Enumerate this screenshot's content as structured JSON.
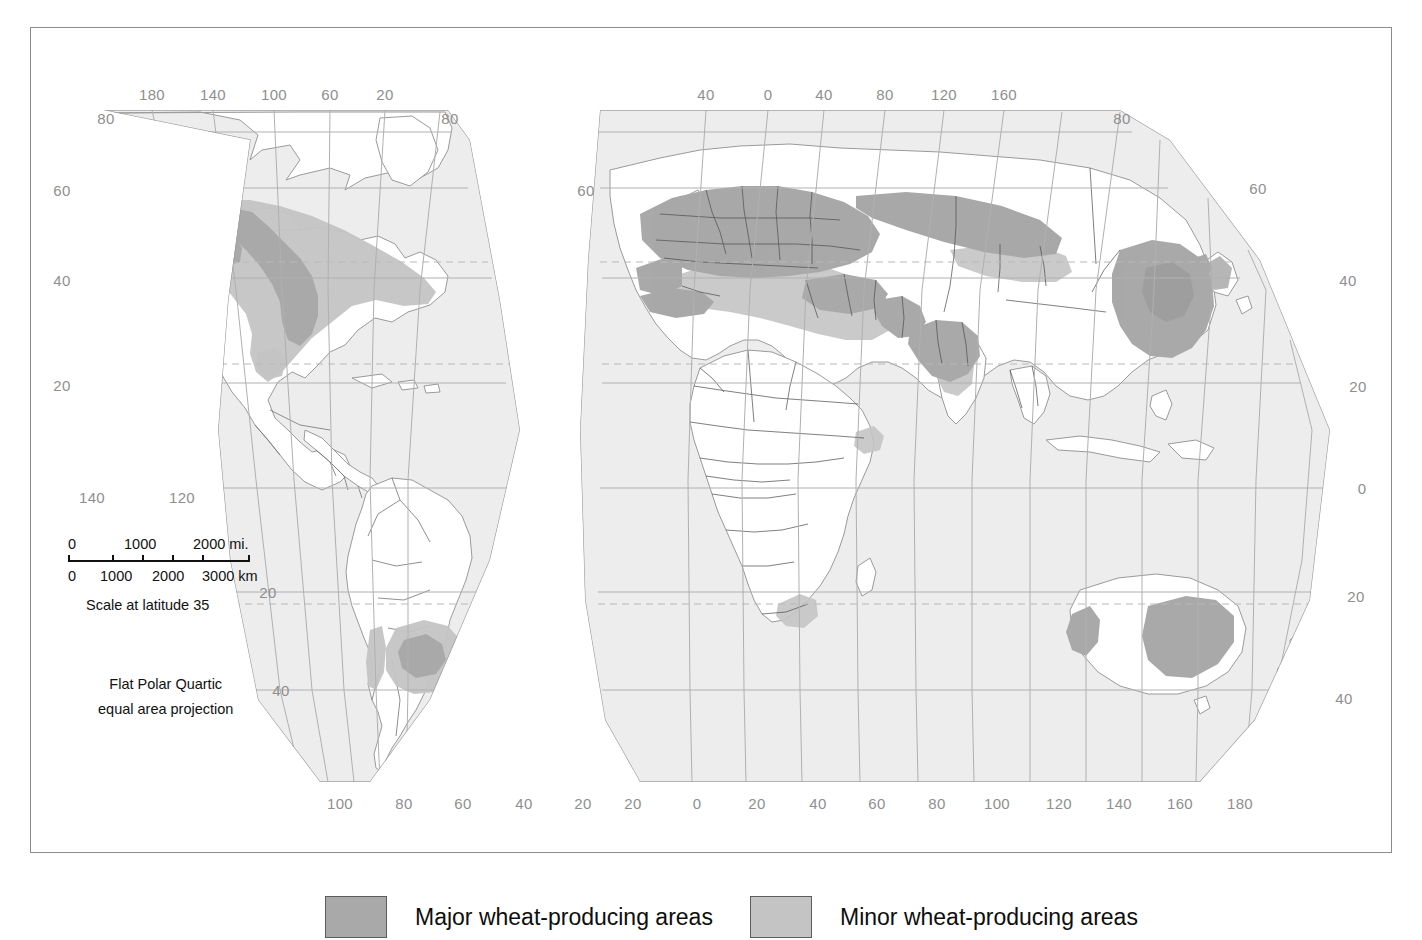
{
  "map": {
    "title": "World wheat production",
    "projection_note_line1": "Flat Polar Quartic",
    "projection_note_line2": "equal area projection",
    "scale_note": "Scale at latitude 35",
    "scale": {
      "miles": {
        "ticks": [
          "0",
          "1000",
          "2000 mi."
        ]
      },
      "km": {
        "ticks": [
          "0",
          "1000",
          "2000",
          "3000 km"
        ]
      }
    },
    "colors": {
      "major_fill": "#a9a9a9",
      "minor_fill": "#c4c4c4",
      "ocean_fill": "#ededed",
      "land_fill": "#ffffff",
      "graticule": "#b0b0b0",
      "coastline": "#9a9a9a",
      "border": "#8c8c8c",
      "tropic_line": "#b9b9b9",
      "label": "#8f8f8f"
    },
    "graticule_labels": {
      "top_left_lobe": [
        {
          "text": "180",
          "x": 152,
          "y": 86
        },
        {
          "text": "140",
          "x": 213,
          "y": 86
        },
        {
          "text": "100",
          "x": 274,
          "y": 86
        },
        {
          "text": "60",
          "x": 330,
          "y": 86
        },
        {
          "text": "20",
          "x": 385,
          "y": 86
        }
      ],
      "top_right_lobe": [
        {
          "text": "40",
          "x": 706,
          "y": 86
        },
        {
          "text": "0",
          "x": 768,
          "y": 86
        },
        {
          "text": "40",
          "x": 824,
          "y": 86
        },
        {
          "text": "80",
          "x": 885,
          "y": 86
        },
        {
          "text": "120",
          "x": 944,
          "y": 86
        },
        {
          "text": "160",
          "x": 1004,
          "y": 86
        }
      ],
      "upper_corner_lat": [
        {
          "text": "80",
          "x": 106,
          "y": 110
        },
        {
          "text": "80",
          "x": 450,
          "y": 110
        },
        {
          "text": "80",
          "x": 1122,
          "y": 110
        }
      ],
      "left_lat": [
        {
          "text": "60",
          "x": 62,
          "y": 182
        },
        {
          "text": "40",
          "x": 62,
          "y": 272
        },
        {
          "text": "20",
          "x": 62,
          "y": 377
        }
      ],
      "mid_left_lat": [
        {
          "text": "60",
          "x": 586,
          "y": 182
        }
      ],
      "right_lat": [
        {
          "text": "60",
          "x": 1258,
          "y": 180
        },
        {
          "text": "40",
          "x": 1348,
          "y": 272
        },
        {
          "text": "20",
          "x": 1358,
          "y": 378
        },
        {
          "text": "0",
          "x": 1362,
          "y": 480
        },
        {
          "text": "20",
          "x": 1356,
          "y": 588
        },
        {
          "text": "40",
          "x": 1344,
          "y": 690
        }
      ],
      "samerica_lon": [
        {
          "text": "140",
          "x": 92,
          "y": 489
        },
        {
          "text": "120",
          "x": 182,
          "y": 489
        }
      ],
      "samerica_lat": [
        {
          "text": "20",
          "x": 268,
          "y": 584
        },
        {
          "text": "40",
          "x": 281,
          "y": 682
        }
      ],
      "bottom_left_lobe": [
        {
          "text": "100",
          "x": 340,
          "y": 795
        },
        {
          "text": "80",
          "x": 404,
          "y": 795
        },
        {
          "text": "60",
          "x": 463,
          "y": 795
        },
        {
          "text": "20",
          "x": 583,
          "y": 795
        },
        {
          "text": "40",
          "x": 524,
          "y": 795
        }
      ],
      "bottom_right_lobe": [
        {
          "text": "20",
          "x": 633,
          "y": 795
        },
        {
          "text": "0",
          "x": 697,
          "y": 795
        },
        {
          "text": "20",
          "x": 757,
          "y": 795
        },
        {
          "text": "40",
          "x": 818,
          "y": 795
        },
        {
          "text": "60",
          "x": 877,
          "y": 795
        },
        {
          "text": "80",
          "x": 937,
          "y": 795
        },
        {
          "text": "100",
          "x": 997,
          "y": 795
        },
        {
          "text": "120",
          "x": 1059,
          "y": 795
        },
        {
          "text": "140",
          "x": 1119,
          "y": 795
        },
        {
          "text": "160",
          "x": 1180,
          "y": 795
        },
        {
          "text": "180",
          "x": 1240,
          "y": 795
        }
      ]
    }
  },
  "legend": {
    "major_label": "Major wheat-producing areas",
    "minor_label": "Minor wheat-producing areas"
  }
}
